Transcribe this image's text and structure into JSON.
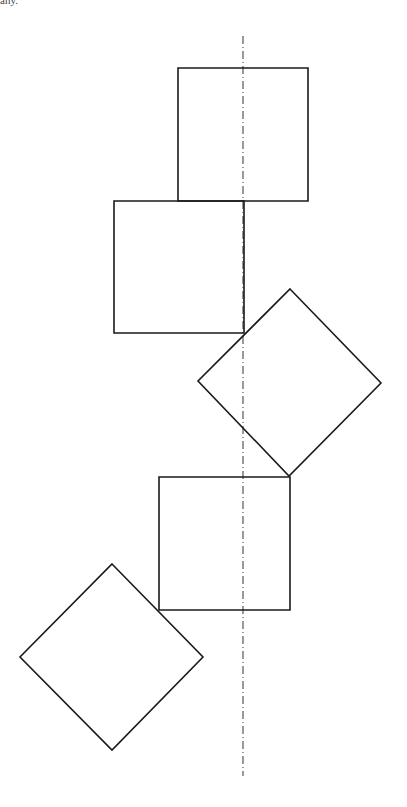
{
  "caption": "any.",
  "diagram": {
    "stroke_color": "#1a1a1a",
    "axis": {
      "x": 243,
      "y1": 36,
      "y2": 776,
      "style": "dash-dot"
    },
    "shapes": [
      {
        "type": "square",
        "points": "178,68 308,68 308,201 178,201"
      },
      {
        "type": "square",
        "points": "114,201 244,201 244,333 114,333"
      },
      {
        "type": "diamond",
        "points": "290,289 381,383 289,476 198,381"
      },
      {
        "type": "square",
        "points": "159,477 290,477 290,610 159,610"
      },
      {
        "type": "diamond",
        "points": "112,564 203,657 112,750 20,657"
      }
    ]
  }
}
